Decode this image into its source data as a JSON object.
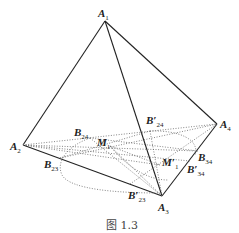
{
  "figure": {
    "caption": "图 1.3",
    "vertices": {
      "A1": {
        "main": "A",
        "sub": "1",
        "x": 105,
        "y": 21
      },
      "A2": {
        "main": "A",
        "sub": "2",
        "x": 23,
        "y": 145
      },
      "A3": {
        "main": "A",
        "sub": "3",
        "x": 162,
        "y": 196
      },
      "A4": {
        "main": "A",
        "sub": "4",
        "x": 217,
        "y": 124
      }
    },
    "points": {
      "B24": {
        "main": "B",
        "sub": "24"
      },
      "B24p": {
        "main": "B′",
        "sub": "24"
      },
      "B23": {
        "main": "B",
        "sub": "23"
      },
      "B23p": {
        "main": "B′",
        "sub": "23"
      },
      "B34": {
        "main": "B",
        "sub": "34"
      },
      "B34p": {
        "main": "B′",
        "sub": "34"
      },
      "M1": {
        "main": "M",
        "sub": "1"
      },
      "M1p": {
        "main": "M′",
        "sub": "1"
      }
    },
    "colors": {
      "line": "#222222",
      "dotted": "#666666",
      "background": "#ffffff"
    }
  }
}
